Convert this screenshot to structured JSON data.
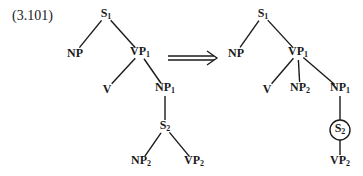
{
  "equation_number": "(3.101)",
  "transformation_arrow": "double-right-arrow",
  "colors": {
    "ink": "#1a1a1a",
    "background": "#ffffff"
  },
  "left_tree": {
    "nodes": [
      {
        "id": "S1",
        "base": "S",
        "sub": "1",
        "x": 106,
        "y": 15
      },
      {
        "id": "NP",
        "base": "NP",
        "sub": "",
        "x": 75,
        "y": 53
      },
      {
        "id": "VP1",
        "base": "VP",
        "sub": "1",
        "x": 140,
        "y": 53
      },
      {
        "id": "V",
        "base": "V",
        "sub": "",
        "x": 107,
        "y": 89
      },
      {
        "id": "NP1",
        "base": "NP",
        "sub": "1",
        "x": 165,
        "y": 89
      },
      {
        "id": "S2",
        "base": "S",
        "sub": "2",
        "x": 165,
        "y": 127
      },
      {
        "id": "NP2",
        "base": "NP",
        "sub": "2",
        "x": 141,
        "y": 162
      },
      {
        "id": "VP2",
        "base": "VP",
        "sub": "2",
        "x": 194,
        "y": 162
      }
    ],
    "edges": [
      [
        "S1",
        "NP"
      ],
      [
        "S1",
        "VP1"
      ],
      [
        "VP1",
        "V"
      ],
      [
        "VP1",
        "NP1"
      ],
      [
        "NP1",
        "S2"
      ],
      [
        "S2",
        "NP2"
      ],
      [
        "S2",
        "VP2"
      ]
    ]
  },
  "right_tree": {
    "nodes": [
      {
        "id": "S1",
        "base": "S",
        "sub": "1",
        "x": 263,
        "y": 15
      },
      {
        "id": "NP",
        "base": "NP",
        "sub": "",
        "x": 236,
        "y": 53
      },
      {
        "id": "VP1",
        "base": "VP",
        "sub": "1",
        "x": 298,
        "y": 53
      },
      {
        "id": "V",
        "base": "V",
        "sub": "",
        "x": 267,
        "y": 89
      },
      {
        "id": "NP2",
        "base": "NP",
        "sub": "2",
        "x": 300,
        "y": 89
      },
      {
        "id": "NP1",
        "base": "NP",
        "sub": "1",
        "x": 340,
        "y": 89
      },
      {
        "id": "S2",
        "base": "S",
        "sub": "2",
        "x": 340,
        "y": 130,
        "circled": true
      },
      {
        "id": "VP2",
        "base": "VP",
        "sub": "2",
        "x": 340,
        "y": 162
      }
    ],
    "edges": [
      [
        "S1",
        "NP"
      ],
      [
        "S1",
        "VP1"
      ],
      [
        "VP1",
        "V"
      ],
      [
        "VP1",
        "NP2"
      ],
      [
        "VP1",
        "NP1"
      ],
      [
        "NP1",
        "S2"
      ],
      [
        "S2",
        "VP2"
      ]
    ]
  }
}
